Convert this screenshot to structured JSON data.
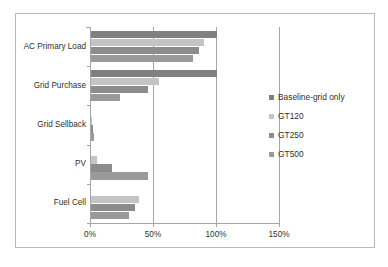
{
  "chart_data": {
    "type": "bar",
    "orientation": "horizontal",
    "title": "",
    "xlabel": "",
    "ylabel": "",
    "categories": [
      "AC Primary Load",
      "Grid Purchase",
      "Grid Sellback",
      "PV",
      "Fuel Cell"
    ],
    "series": [
      {
        "name": "Baseline-grid only",
        "color": "#808080",
        "values": [
          100,
          100,
          0,
          0,
          0
        ]
      },
      {
        "name": "GT120",
        "color": "#c4c4c4",
        "values": [
          90,
          54,
          1,
          5,
          38
        ]
      },
      {
        "name": "GT250",
        "color": "#8c8c8c",
        "values": [
          86,
          45,
          1.5,
          17,
          35
        ]
      },
      {
        "name": "GT500",
        "color": "#9a9a9a",
        "values": [
          81,
          23,
          2,
          45,
          30
        ]
      }
    ],
    "xticks": [
      0,
      50,
      100,
      150
    ],
    "xtick_labels": [
      "0%",
      "50%",
      "100%",
      "150%"
    ],
    "xlim": [
      0,
      150
    ],
    "gridlines": [
      "50%",
      "100%",
      "150%"
    ],
    "legend_position": "right",
    "legend_entries": [
      "Baseline-grid only",
      "GT120",
      "GT250",
      "GT500"
    ]
  }
}
